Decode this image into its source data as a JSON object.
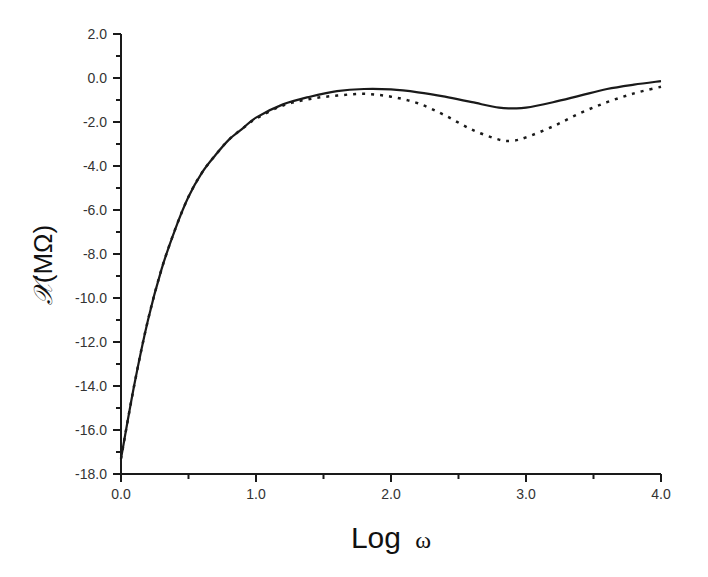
{
  "chart_data": {
    "type": "line",
    "title": "",
    "xlabel": "Log ω",
    "xlabel_parts": {
      "main": "Log",
      "symbol": "ω"
    },
    "ylabel": "𝒳(MΩ)",
    "ylabel_parts": {
      "symbol": "𝒳",
      "unit": "(MΩ)"
    },
    "xlim": [
      0.0,
      4.0
    ],
    "ylim": [
      -18.0,
      2.0
    ],
    "xticks": [
      "0.0",
      "1.0",
      "2.0",
      "3.0",
      "4.0"
    ],
    "yticks": [
      "2.0",
      "0.0",
      "-2.0",
      "-4.0",
      "-6.0",
      "-8.0",
      "-10.0",
      "-12.0",
      "-14.0",
      "-16.0",
      "-18.0"
    ],
    "grid": false,
    "legend": null,
    "x": [
      0.0,
      0.1,
      0.2,
      0.3,
      0.4,
      0.5,
      0.6,
      0.7,
      0.8,
      0.9,
      1.0,
      1.2,
      1.4,
      1.6,
      1.8,
      2.0,
      2.2,
      2.4,
      2.6,
      2.8,
      2.9,
      3.0,
      3.2,
      3.4,
      3.6,
      3.8,
      4.0
    ],
    "series": [
      {
        "name": "solid",
        "style": "solid",
        "color": "#1a1a1a",
        "values": [
          -17.3,
          -13.9,
          -11.0,
          -8.7,
          -6.9,
          -5.4,
          -4.3,
          -3.5,
          -2.8,
          -2.3,
          -1.8,
          -1.2,
          -0.85,
          -0.6,
          -0.5,
          -0.52,
          -0.65,
          -0.85,
          -1.1,
          -1.35,
          -1.38,
          -1.35,
          -1.1,
          -0.8,
          -0.5,
          -0.3,
          -0.14
        ]
      },
      {
        "name": "dotted",
        "style": "dotted",
        "color": "#1a1a1a",
        "values": [
          -17.3,
          -13.9,
          -11.0,
          -8.7,
          -6.9,
          -5.4,
          -4.3,
          -3.5,
          -2.8,
          -2.3,
          -1.85,
          -1.25,
          -0.95,
          -0.8,
          -0.72,
          -0.85,
          -1.15,
          -1.7,
          -2.35,
          -2.8,
          -2.85,
          -2.7,
          -2.2,
          -1.6,
          -1.1,
          -0.7,
          -0.4
        ]
      }
    ]
  }
}
